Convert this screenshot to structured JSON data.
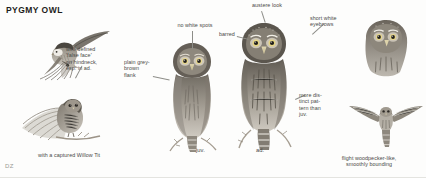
{
  "plate": {
    "title": "PYGMY OWL",
    "artist_signature": "DZ"
  },
  "captions": [
    {
      "id": "false-face",
      "text": "well-defined\n'false face'\non hindneck,\nesp. in ad."
    },
    {
      "id": "no-white-spots",
      "text": "no white spots"
    },
    {
      "id": "plain-flank",
      "text": "plain grey-\nbrown\nflank"
    },
    {
      "id": "austere-look",
      "text": "austere look"
    },
    {
      "id": "barred",
      "text": "barred"
    },
    {
      "id": "short-eyebrows",
      "text": "short white\neyebrows"
    },
    {
      "id": "more-distinct",
      "text": "more dis-\ntinct pat-\ntern than\njuv."
    },
    {
      "id": "willow-tit",
      "text": "with a captured Willow Tit"
    },
    {
      "id": "flight",
      "text": "flight woodpecker-like,\nsmoothly bounding"
    }
  ],
  "age_labels": [
    {
      "id": "juv",
      "text": "juv."
    },
    {
      "id": "ad",
      "text": "ad."
    }
  ],
  "figures": [
    {
      "id": "owl-flying-with-prey-upper",
      "name": "owl-in-flight-carrying-tit"
    },
    {
      "id": "owl-perched-spread-tail",
      "name": "owl-perched-lower-left"
    },
    {
      "id": "owl-juvenile-perched",
      "name": "owl-juvenile-front"
    },
    {
      "id": "owl-adult-perched",
      "name": "owl-adult-front"
    },
    {
      "id": "owl-adult-head-right",
      "name": "owl-adult-head-study"
    },
    {
      "id": "owl-flight-silhouette",
      "name": "owl-flight-from-below"
    }
  ],
  "colors": {
    "ink": "#3a3a38",
    "title": "#1d1d1b",
    "leader": "#8d8d88",
    "plumage_dark": "#6f6a61",
    "plumage_mid": "#9b958a",
    "plumage_light": "#cfcac1",
    "paper": "#fdfdfc"
  }
}
